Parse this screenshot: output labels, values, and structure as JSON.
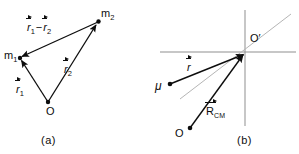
{
  "figure": {
    "kind": "physics-vector-diagram",
    "background": "#ffffff",
    "ink": "#0d0d0d",
    "guide_color": "#a8a8a8"
  },
  "panel_a": {
    "caption": "(a)",
    "points": [
      {
        "id": "m1",
        "label_base": "m",
        "label_sub": "1",
        "x": 20,
        "y": 58
      },
      {
        "id": "m2",
        "label_base": "m",
        "label_sub": "2",
        "x": 98,
        "y": 22
      },
      {
        "id": "O",
        "label_base": "O",
        "label_sub": "",
        "x": 48,
        "y": 102
      }
    ],
    "vectors": [
      {
        "id": "r1",
        "base": "r",
        "sub": "1",
        "from": "O",
        "to": "m1",
        "label": "r1"
      },
      {
        "id": "r2",
        "base": "r",
        "sub": "2",
        "from": "O",
        "to": "m2",
        "label": "r2"
      },
      {
        "id": "r1-minus-r2",
        "base": "r",
        "sub": "1",
        "from": "m2",
        "to": "m1",
        "label": "r1 - r2"
      }
    ],
    "labels": {
      "m1": "m",
      "m1_sub": "1",
      "m2": "m",
      "m2_sub": "2",
      "origin": "O",
      "r1": "r",
      "r1_sub": "1",
      "r2": "r",
      "r2_sub": "2",
      "diff_first": "r",
      "diff_first_sub": "1",
      "diff_minus": "−",
      "diff_second": "r",
      "diff_second_sub": "2"
    }
  },
  "panel_b": {
    "caption": "(b)",
    "axes": {
      "origin_label": "O′",
      "origin_x": 245,
      "origin_y": 52,
      "h_from_x": 160,
      "h_to_x": 296,
      "v_from_y": 10,
      "v_to_y": 126
    },
    "guide_line": {
      "from_x": 291,
      "from_y": 14,
      "to_x": 180,
      "to_y": 99
    },
    "points": [
      {
        "id": "mu",
        "label": "μ",
        "x": 170,
        "y": 84
      },
      {
        "id": "O",
        "label": "O",
        "x": 190,
        "y": 128
      }
    ],
    "vectors": [
      {
        "id": "r",
        "base": "r",
        "sub": "",
        "from": "mu",
        "to": "Oprime",
        "label": "r"
      },
      {
        "id": "R_CM",
        "base": "R",
        "sub": "CM",
        "from": "O",
        "to": "Oprime",
        "label": "R CM"
      }
    ],
    "labels": {
      "origin_prime": "O′",
      "mu": "μ",
      "origin": "O",
      "r": "r",
      "R": "R",
      "R_sub": "CM"
    }
  }
}
